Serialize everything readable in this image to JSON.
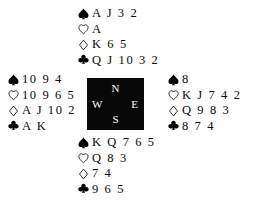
{
  "diagram": {
    "type": "bridge-hand-deal-diagram",
    "background_color": "#ffffff",
    "text_color": "#000000",
    "compass_box_color": "#080808",
    "compass_label_color": "#ffffff"
  },
  "compass": {
    "north": "N",
    "west": "W",
    "east": "E",
    "south": "S"
  },
  "suits": {
    "spade": "spade-suit-symbol",
    "heart": "heart-suit-symbol",
    "diamond": "diamond-suit-symbol",
    "club": "club-suit-symbol"
  },
  "hands": {
    "north": {
      "position": "North",
      "spades": "A J 3 2",
      "hearts": "A",
      "diamonds": "K 6 5",
      "clubs": "Q J 10 3 2"
    },
    "west": {
      "position": "West",
      "spades": "10 9 4",
      "hearts": "10 9 6 5",
      "diamonds": "A J 10 2",
      "clubs": "A K"
    },
    "east": {
      "position": "East",
      "spades": "8",
      "hearts": "K J 7 4 2",
      "diamonds": "Q 9 8 3",
      "clubs": "8 7 4"
    },
    "south": {
      "position": "South",
      "spades": "K Q 7 6 5",
      "hearts": "Q 8 3",
      "diamonds": "7 4",
      "clubs": "9 6 5"
    }
  }
}
